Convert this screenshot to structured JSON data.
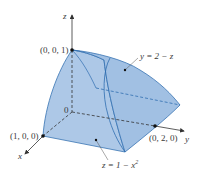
{
  "figure": {
    "axes": {
      "x_label": "x",
      "y_label": "y",
      "z_label": "z",
      "origin_label": "0"
    },
    "points": {
      "z_intercept": "(0, 0, 1)",
      "x_intercept": "(1, 0, 0)",
      "y_intercept": "(0, 2, 0)"
    },
    "surfaces": {
      "plane": "y = 2 − z",
      "cylinder_prefix": "z = 1 − x",
      "cylinder_exp": "2"
    },
    "colors": {
      "solid_fill": "#a9c6e6",
      "solid_fill_dark": "#8fb2da",
      "edge": "#2f6db0",
      "axis": "#333333",
      "text": "#3a3a3a"
    }
  }
}
